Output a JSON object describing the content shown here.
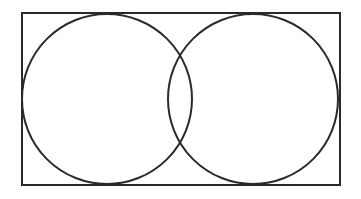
{
  "diagram": {
    "type": "venn",
    "stroke_color": "#2a2a2a",
    "background": "#ffffff",
    "universe": {
      "x": 22,
      "y": 13,
      "width": 318,
      "height": 172
    },
    "sets": [
      {
        "name": "left-set",
        "cx": 107,
        "cy": 99,
        "r": 85
      },
      {
        "name": "right-set",
        "cx": 253,
        "cy": 99,
        "r": 85
      }
    ]
  }
}
